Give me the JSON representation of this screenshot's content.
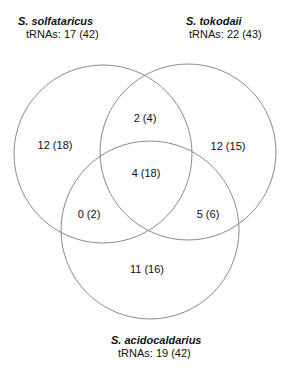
{
  "sets": [
    {
      "name": "S. solfataricus",
      "count_label": "tRNAs: 17 (42)"
    },
    {
      "name": "S. tokodaii",
      "count_label": "tRNAs: 22 (43)"
    },
    {
      "name": "S. acidocaldarius",
      "count_label": "tRNAs: 19 (42)"
    }
  ],
  "regions": {
    "solfataricus_only": "12 (18)",
    "tokodaii_only": "12 (15)",
    "acidocaldarius_only": "11 (16)",
    "solfataricus_tokodaii": "2 (4)",
    "solfataricus_acidocaldarius": "0 (2)",
    "tokodaii_acidocaldarius": "5 (6)",
    "all_three": "4 (18)"
  },
  "colors": {
    "circle_stroke": "#8a8a8a",
    "text": "#111111"
  }
}
